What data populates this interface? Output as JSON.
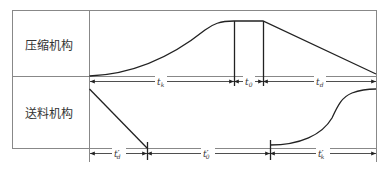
{
  "diagram": {
    "type": "timing-cycle-diagram",
    "rows": [
      {
        "label": "压缩机构",
        "segments": [
          {
            "label": "t_k",
            "base": "t",
            "sub": "k",
            "prime": false
          },
          {
            "label": "t_0",
            "base": "t",
            "sub": "0",
            "prime": false
          },
          {
            "label": "t_d",
            "base": "t",
            "sub": "d",
            "prime": false
          }
        ]
      },
      {
        "label": "送料机构",
        "segments": [
          {
            "label": "t'_d",
            "base": "t",
            "sub": "d",
            "prime": true
          },
          {
            "label": "t'_0",
            "base": "t",
            "sub": "0",
            "prime": true
          },
          {
            "label": "t'_k",
            "base": "t",
            "sub": "k",
            "prime": true
          }
        ]
      }
    ]
  },
  "labels": {
    "row1": "压缩机构",
    "row2": "送料机构",
    "t_k": "t",
    "t_k_sub": "k",
    "t_0": "t",
    "t_0_sub": "0",
    "t_d": "t",
    "t_d_sub": "d",
    "tp_d": "t′",
    "tp_d_sub": "d",
    "tp_0": "t′",
    "tp_0_sub": "0",
    "tp_k": "t′",
    "tp_k_sub": "k"
  },
  "colors": {
    "line": "#222222",
    "grid": "#888888",
    "text": "#333333"
  }
}
